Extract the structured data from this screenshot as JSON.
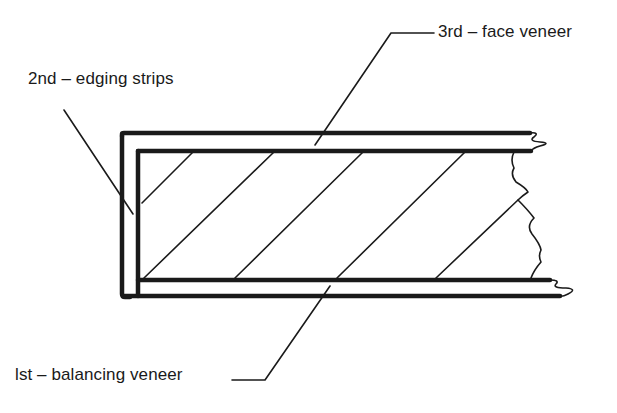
{
  "diagram": {
    "labels": {
      "face_veneer": "3rd – face veneer",
      "edging_strips": "2nd – edging strips",
      "balancing_veneer": "lst – balancing veneer"
    },
    "caption_partial": "",
    "colors": {
      "ink": "#1a1a1a",
      "background": "#ffffff"
    }
  }
}
